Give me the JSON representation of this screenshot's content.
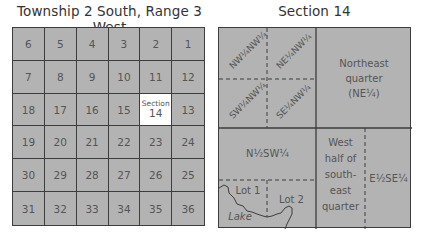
{
  "left_panel": {
    "title": "Township 2 South, Range 3 West",
    "highlighted_section": 14,
    "highlight_label_small": "Section",
    "rows": [
      [
        "6",
        "5",
        "4",
        "3",
        "2",
        "1"
      ],
      [
        "7",
        "8",
        "9",
        "10",
        "11",
        "12"
      ],
      [
        "18",
        "17",
        "16",
        "15",
        "14",
        "13"
      ],
      [
        "19",
        "20",
        "21",
        "22",
        "23",
        "24"
      ],
      [
        "30",
        "29",
        "28",
        "27",
        "26",
        "25"
      ],
      [
        "31",
        "32",
        "33",
        "34",
        "35",
        "36"
      ]
    ]
  },
  "right_panel": {
    "title": "Section 14",
    "nw_quarter_subdivisions": {
      "nw": "NW¼NW¼",
      "ne": "NE¼NW¼",
      "sw": "SW¼NW¼",
      "se": "SE¼NW¼"
    },
    "northeast_quarter": {
      "line1": "Northeast",
      "line2": "quarter",
      "line3": "(NE¼)"
    },
    "n_half_sw_quarter": "N½SW¼",
    "lot1": "Lot 1",
    "lot2": "Lot 2",
    "lake": "Lake",
    "west_half_se": {
      "line1": "West",
      "line2": "half of",
      "line3": "south-",
      "line4": "east",
      "line5": "quarter"
    },
    "e_half_se_quarter": "E½SE¼"
  },
  "colors": {
    "fill": "#b3b3b3",
    "line": "#3d3d3d",
    "highlight": "#ffffff",
    "text": "#555555"
  }
}
